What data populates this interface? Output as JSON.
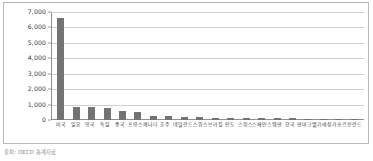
{
  "caption": "출처: OECD 통계자료",
  "colors": {
    "bar": "#737373",
    "gridline": "#cfcfcf",
    "axis": "#8f8f8f",
    "frame_border": "#b9b9b9",
    "tick_text": "#3b3b3b",
    "caption_text": "#8d8d8d",
    "background": "#ffffff"
  },
  "chart_data": {
    "type": "bar",
    "title": "",
    "subtitle": "",
    "xlabel": "",
    "ylabel": "",
    "ylim": [
      0,
      7000
    ],
    "yticks": [
      0,
      1000,
      2000,
      3000,
      4000,
      5000,
      6000,
      7000
    ],
    "ytick_labels": [
      "0",
      "1,000",
      "2,000",
      "3,000",
      "4,000",
      "5,000",
      "6,000",
      "7,000"
    ],
    "grid": true,
    "legend": false,
    "legend_position": "none",
    "orientation": "vertical",
    "categories": [
      "미국",
      "일본",
      "영국",
      "독일",
      "중국",
      "프랑스",
      "캐나다",
      "호주",
      "네덜란드",
      "스위스",
      "브라질",
      "인도",
      "스위스",
      "스페인",
      "스웨덴",
      "한국",
      "덴마크",
      "벨기에",
      "싱가포르",
      "핀란드"
    ],
    "values": [
      6620,
      860,
      840,
      760,
      560,
      500,
      290,
      250,
      185,
      170,
      160,
      150,
      145,
      140,
      125,
      110,
      95,
      70,
      55,
      45
    ]
  }
}
